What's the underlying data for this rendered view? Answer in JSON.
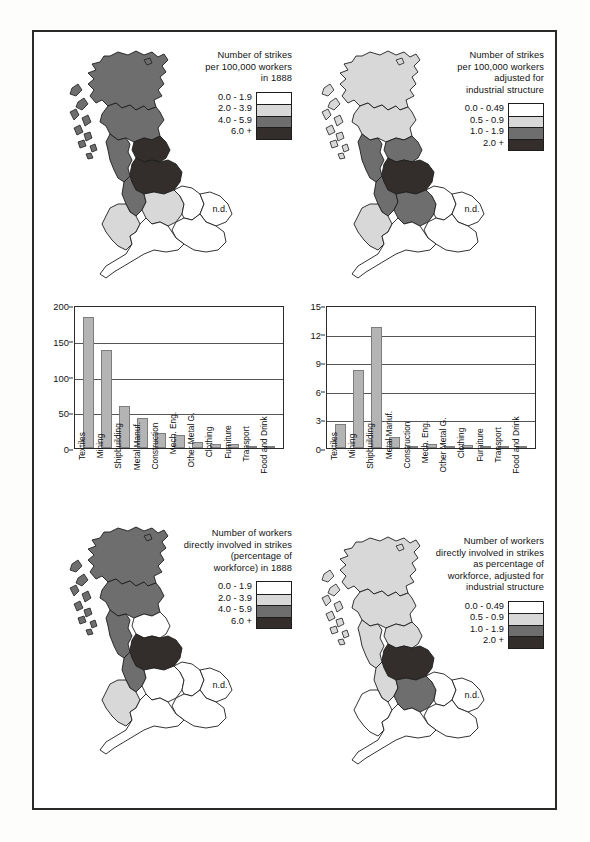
{
  "figure": {
    "background": "#fdfdfb",
    "frame_color": "#2a2a28"
  },
  "shading": {
    "level0": "#ffffff",
    "level1": "#d8d8d8",
    "level2": "#6e6e6e",
    "level3": "#332e2b",
    "outline": "#1d1d1d",
    "bar_fill": "#b4b4b4",
    "bar_stroke": "#7d7d7d"
  },
  "maps": {
    "top_left": {
      "name": "strikes-per-100000-workers-1888",
      "nd_label": "n.d.",
      "legend": {
        "title_lines": [
          "Number of strikes",
          "per 100,000 workers",
          "in 1888"
        ],
        "classes": [
          {
            "label": "0.0 - 1.9",
            "shade": "level0"
          },
          {
            "label": "2.0 - 3.9",
            "shade": "level1"
          },
          {
            "label": "4.0 - 5.9",
            "shade": "level2"
          },
          {
            "label": "6.0 +",
            "shade": "level3"
          }
        ]
      },
      "regions": {
        "scotland_north": "level2",
        "scotland_south": "level2",
        "north_east": "level3",
        "north_west": "level2",
        "yorkshire": "level3",
        "lancashire": "level2",
        "midlands_west": "level1",
        "wales": "level1",
        "midlands_east": "level0",
        "east_anglia": "level0",
        "south_east": "level0",
        "south_west": "level0"
      }
    },
    "top_right": {
      "name": "strikes-per-100000-workers-adjusted",
      "nd_label": "n.d.",
      "legend": {
        "title_lines": [
          "Number of strikes",
          "per 100,000 workers",
          "adjusted for",
          "industrial structure"
        ],
        "classes": [
          {
            "label": "0.0 - 0.49",
            "shade": "level0"
          },
          {
            "label": "0.5 - 0.9",
            "shade": "level1"
          },
          {
            "label": "1.0 - 1.9",
            "shade": "level2"
          },
          {
            "label": "2.0 +",
            "shade": "level3"
          }
        ]
      },
      "regions": {
        "scotland_north": "level1",
        "scotland_south": "level1",
        "north_east": "level2",
        "north_west": "level2",
        "yorkshire": "level3",
        "lancashire": "level2",
        "midlands_west": "level2",
        "wales": "level1",
        "midlands_east": "level0",
        "east_anglia": "level0",
        "south_east": "level0",
        "south_west": "level0"
      }
    },
    "bottom_left": {
      "name": "workers-involved-in-strikes-1888",
      "nd_label": "n.d.",
      "legend": {
        "title_lines": [
          "Number of workers",
          "directly involved in strikes",
          "(percentage of",
          "workforce) in 1888"
        ],
        "classes": [
          {
            "label": "0.0 - 1.9",
            "shade": "level0"
          },
          {
            "label": "2.0 - 3.9",
            "shade": "level1"
          },
          {
            "label": "4.0 - 5.9",
            "shade": "level2"
          },
          {
            "label": "6.0 +",
            "shade": "level3"
          }
        ]
      },
      "regions": {
        "scotland_north": "level2",
        "scotland_south": "level2",
        "north_east": "level0",
        "north_west": "level2",
        "yorkshire": "level3",
        "lancashire": "level2",
        "midlands_west": "level0",
        "wales": "level1",
        "midlands_east": "level0",
        "east_anglia": "level0",
        "south_east": "level0",
        "south_west": "level0"
      }
    },
    "bottom_right": {
      "name": "workers-involved-in-strikes-adjusted",
      "nd_label": "n.d.",
      "legend": {
        "title_lines": [
          "Number of workers",
          "directly involved in strikes",
          "as percentage of",
          "workforce, adjusted for",
          "industrial structure"
        ],
        "classes": [
          {
            "label": "0.0 - 0.49",
            "shade": "level0"
          },
          {
            "label": "0.5 - 0.9",
            "shade": "level1"
          },
          {
            "label": "1.0 - 1.9",
            "shade": "level2"
          },
          {
            "label": "2.0 +",
            "shade": "level3"
          }
        ]
      },
      "regions": {
        "scotland_north": "level1",
        "scotland_south": "level1",
        "north_east": "level1",
        "north_west": "level1",
        "yorkshire": "level3",
        "lancashire": "level1",
        "midlands_west": "level2",
        "wales": "level0",
        "midlands_east": "level0",
        "east_anglia": "level0",
        "south_east": "level0",
        "south_west": "level0"
      }
    }
  },
  "chart_data": [
    {
      "name": "strikes-by-industry-1888",
      "type": "bar",
      "title": "",
      "xlabel": "",
      "ylabel": "",
      "ylim": [
        0,
        200
      ],
      "yticks": [
        0,
        50,
        100,
        150,
        200
      ],
      "grid": true,
      "categories": [
        "Textiles",
        "Mining",
        "Shipbuilding",
        "Metal Manuf.",
        "Construction",
        "Mech. Eng.",
        "Other Metal G.",
        "Clothing",
        "Furniture",
        "Transport",
        "Food and Drink"
      ],
      "values": [
        183,
        137,
        59,
        42,
        21,
        18,
        8,
        5,
        5,
        3,
        1
      ]
    },
    {
      "name": "strikes-by-industry-adjusted",
      "type": "bar",
      "title": "",
      "xlabel": "",
      "ylabel": "",
      "ylim": [
        0,
        15
      ],
      "yticks": [
        0,
        3,
        6,
        9,
        12,
        15
      ],
      "grid": true,
      "categories": [
        "Textiles",
        "Mining",
        "Shipbuilding",
        "Metal Manuf.",
        "Construction",
        "Mech. Eng.",
        "Other Metal G.",
        "Clothing",
        "Furniture",
        "Transport",
        "Food and Drink"
      ],
      "values": [
        2.5,
        8.2,
        12.7,
        1.2,
        0.05,
        0.45,
        0.1,
        0.35,
        0.05,
        0.03,
        0.03
      ]
    }
  ]
}
